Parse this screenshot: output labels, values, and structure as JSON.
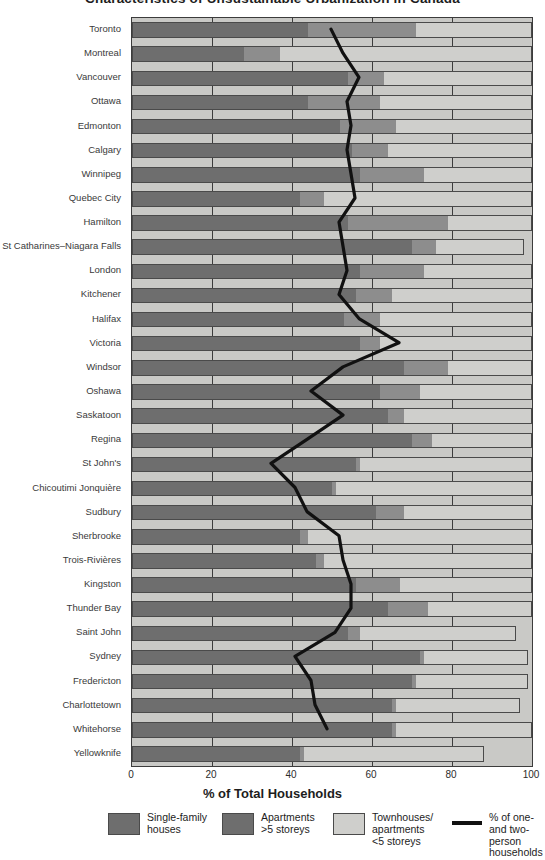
{
  "title": "Characteristics of Unsustainable Urbanization in Canada",
  "axis": {
    "x_title": "% of Total Households",
    "x_ticks": [
      "0",
      "20",
      "40",
      "60",
      "80",
      "100"
    ],
    "x_min": 0,
    "x_max": 100
  },
  "legend": [
    {
      "icon": "swatch-dark",
      "label": "Single-family\nhouses",
      "color": "#6e6e6e"
    },
    {
      "icon": "swatch-mid",
      "label": "Apartments\n>5 storeys",
      "color": "#6e6e6e"
    },
    {
      "icon": "swatch-light",
      "label": "Townhouses/\napartments\n<5 storeys",
      "color": "#cfcfcc"
    },
    {
      "icon": "line-swatch",
      "label": "% of one- and two-\nperson households",
      "color": "#111111"
    }
  ],
  "colors": {
    "single_family": "#6e6e6e",
    "apartments_over5": "#8d8d8d",
    "townhouses_under5": "#cfcfcc",
    "line": "#111111",
    "plot_background": "#c9c9c6",
    "axis": "#3c3c3c"
  },
  "chart_data": {
    "type": "bar",
    "orientation": "horizontal",
    "stacked": true,
    "title": "Characteristics of Unsustainable Urbanization in Canada",
    "xlabel": "% of Total Households",
    "ylabel": "",
    "xlim": [
      0,
      100
    ],
    "grid": true,
    "legend_position": "bottom",
    "categories": [
      "Toronto",
      "Montreal",
      "Vancouver",
      "Ottawa",
      "Edmonton",
      "Calgary",
      "Winnipeg",
      "Quebec City",
      "Hamilton",
      "St Catharines–Niagara Falls",
      "London",
      "Kitchener",
      "Halifax",
      "Victoria",
      "Windsor",
      "Oshawa",
      "Saskatoon",
      "Regina",
      "St John's",
      "Chicoutimi Jonquière",
      "Sudbury",
      "Sherbrooke",
      "Trois-Rivières",
      "Kingston",
      "Thunder Bay",
      "Saint John",
      "Sydney",
      "Fredericton",
      "Charlottetown",
      "Whitehorse",
      "Yellowknife"
    ],
    "series": [
      {
        "name": "Single-family houses",
        "color": "#6e6e6e",
        "values": [
          44,
          28,
          54,
          44,
          52,
          55,
          57,
          42,
          54,
          70,
          57,
          56,
          53,
          57,
          68,
          62,
          64,
          70,
          56,
          50,
          61,
          42,
          46,
          56,
          64,
          54,
          72,
          70,
          65,
          65,
          42
        ]
      },
      {
        "name": "Apartments >5 storeys",
        "color": "#8d8d8d",
        "values": [
          27,
          9,
          9,
          18,
          14,
          9,
          16,
          6,
          25,
          6,
          16,
          9,
          9,
          5,
          11,
          10,
          4,
          5,
          1,
          1,
          7,
          2,
          2,
          11,
          10,
          3,
          1,
          1,
          1,
          1,
          1
        ]
      },
      {
        "name": "Townhouses/apartments <5 storeys",
        "color": "#cfcfcc",
        "values": [
          29,
          63,
          37,
          38,
          34,
          36,
          27,
          52,
          21,
          22,
          27,
          35,
          38,
          38,
          21,
          28,
          32,
          25,
          43,
          49,
          32,
          56,
          52,
          33,
          26,
          39,
          26,
          28,
          31,
          34,
          45
        ]
      }
    ],
    "line_series": {
      "name": "% of one- and two-person households",
      "color": "#111111",
      "values": [
        50,
        53,
        57,
        54,
        55,
        54,
        55,
        56,
        52,
        53,
        54,
        52,
        57,
        67,
        53,
        45,
        53,
        44,
        35,
        41,
        44,
        52,
        53,
        55,
        55,
        51,
        41,
        45,
        46,
        49,
        null
      ]
    }
  }
}
